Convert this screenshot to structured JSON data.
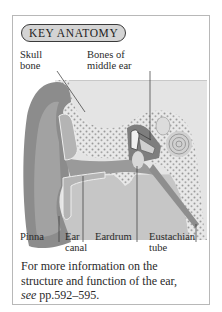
{
  "panel": {
    "badge_label": "KEY ANATOMY",
    "labels": {
      "skull_bone_1": "Skull",
      "skull_bone_2": "bone",
      "bones_middle_ear_1": "Bones of",
      "bones_middle_ear_2": "middle ear",
      "pinna": "Pinna",
      "ear_canal_1": "Ear",
      "ear_canal_2": "canal",
      "eardrum": "Eardrum",
      "eustachian_1": "Eustachian",
      "eustachian_2": "tube"
    },
    "caption": {
      "line1": "For more information on the",
      "line2": "structure and function of the ear,",
      "see": "see",
      "pages": " pp.592–595."
    },
    "colors": {
      "badge_fill": "#d4d4d4",
      "badge_border": "#3a3a3a",
      "frame_border": "#b8b8b8",
      "skin_dark": "#8a8a8a",
      "skin_mid": "#a8a8a8",
      "bone": "#e6e6e6",
      "background_tissue": "#c4c4c4"
    }
  }
}
